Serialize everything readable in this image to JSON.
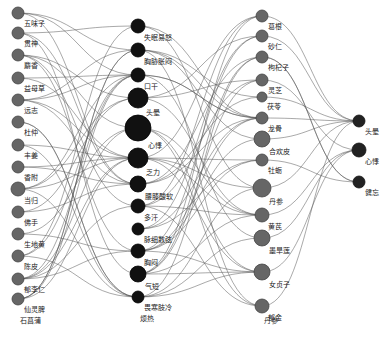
{
  "diagram": {
    "type": "multi-layer network graph",
    "columns": [
      {
        "name": "herbs-left",
        "x": 18,
        "fill": "#666666",
        "stroke": "#444444",
        "nodes": [
          {
            "id": "L0",
            "label": "五味子",
            "y": 13,
            "r": 6
          },
          {
            "id": "L1",
            "label": "贯神",
            "y": 33,
            "r": 6
          },
          {
            "id": "L2",
            "label": "麝香",
            "y": 55,
            "r": 6
          },
          {
            "id": "L3",
            "label": "益母草",
            "y": 78,
            "r": 6
          },
          {
            "id": "L4",
            "label": "远志",
            "y": 100,
            "r": 6
          },
          {
            "id": "L5",
            "label": "杜仲",
            "y": 122,
            "r": 6
          },
          {
            "id": "L6",
            "label": "丰姜",
            "y": 145,
            "r": 6
          },
          {
            "id": "L7",
            "label": "香附",
            "y": 167,
            "r": 6
          },
          {
            "id": "L8",
            "label": "当归",
            "y": 189,
            "r": 7
          },
          {
            "id": "L9",
            "label": "佛手",
            "y": 212,
            "r": 6
          },
          {
            "id": "L10",
            "label": "生地黄",
            "y": 234,
            "r": 6
          },
          {
            "id": "L11",
            "label": "陈皮",
            "y": 256,
            "r": 6
          },
          {
            "id": "L12",
            "label": "郁李仁",
            "y": 279,
            "r": 6
          },
          {
            "id": "L13",
            "label": "仙灵脾",
            "y": 299,
            "r": 6
          },
          {
            "id": "L14",
            "label": "石菖蒲",
            "y": 320,
            "r": 0
          }
        ]
      },
      {
        "name": "symptoms-middle",
        "x": 138,
        "fill": "#111111",
        "stroke": "#000000",
        "nodes": [
          {
            "id": "M0",
            "label": "失眠易怒",
            "y": 26,
            "r": 7
          },
          {
            "id": "M1",
            "label": "胸胁胀闷",
            "y": 50,
            "r": 7
          },
          {
            "id": "M2",
            "label": "口干",
            "y": 75,
            "r": 7
          },
          {
            "id": "M3",
            "label": "头晕",
            "y": 98,
            "r": 10
          },
          {
            "id": "M4",
            "label": "心悸",
            "y": 128,
            "r": 13
          },
          {
            "id": "M5",
            "label": "乏力",
            "y": 158,
            "r": 10
          },
          {
            "id": "M6",
            "label": "腰膝酸软",
            "y": 184,
            "r": 8
          },
          {
            "id": "M7",
            "label": "多汗",
            "y": 206,
            "r": 7
          },
          {
            "id": "M8",
            "label": "脉细数弦",
            "y": 229,
            "r": 6
          },
          {
            "id": "M9",
            "label": "胸闷",
            "y": 251,
            "r": 7
          },
          {
            "id": "M10",
            "label": "气短",
            "y": 274,
            "r": 8
          },
          {
            "id": "M11",
            "label": "畏寒肢冷",
            "y": 297,
            "r": 6
          },
          {
            "id": "M12",
            "label": "烦热",
            "y": 318,
            "r": 0
          }
        ]
      },
      {
        "name": "herbs-right",
        "x": 262,
        "fill": "#666666",
        "stroke": "#444444",
        "nodes": [
          {
            "id": "R0",
            "label": "葛根",
            "y": 16,
            "r": 6
          },
          {
            "id": "R1",
            "label": "砂仁",
            "y": 36,
            "r": 6
          },
          {
            "id": "R2",
            "label": "枸杞子",
            "y": 57,
            "r": 6
          },
          {
            "id": "R3",
            "label": "灵芝",
            "y": 80,
            "r": 6
          },
          {
            "id": "R4",
            "label": "茯苓",
            "y": 97,
            "r": 5
          },
          {
            "id": "R5",
            "label": "龙骨",
            "y": 118,
            "r": 6
          },
          {
            "id": "R6",
            "label": "合欢皮",
            "y": 139,
            "r": 8
          },
          {
            "id": "R7",
            "label": "牡蛎",
            "y": 160,
            "r": 6
          },
          {
            "id": "R8",
            "label": "丹参",
            "y": 188,
            "r": 9
          },
          {
            "id": "R9",
            "label": "黄芪",
            "y": 215,
            "r": 7
          },
          {
            "id": "R10",
            "label": "墨旱莲",
            "y": 238,
            "r": 8
          },
          {
            "id": "R11",
            "label": "女贞子",
            "y": 272,
            "r": 8
          },
          {
            "id": "R12",
            "label": "郁金",
            "y": 306,
            "r": 7
          },
          {
            "id": "R13",
            "label": "丹参",
            "y": 320,
            "r": 0
          }
        ]
      },
      {
        "name": "diseases-right",
        "x": 359,
        "fill": "#222222",
        "stroke": "#111111",
        "nodes": [
          {
            "id": "D0",
            "label": "头晕",
            "y": 121,
            "r": 6
          },
          {
            "id": "D1",
            "label": "心悸",
            "y": 150,
            "r": 7
          },
          {
            "id": "D2",
            "label": "健忘",
            "y": 182,
            "r": 6
          }
        ]
      }
    ],
    "edge_color": "#555555"
  }
}
